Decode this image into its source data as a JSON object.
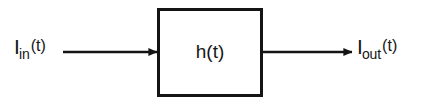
{
  "diagram": {
    "type": "block-diagram",
    "background_color": "#ffffff",
    "stroke_color": "#141414",
    "text_color": "#161616",
    "input": {
      "symbol": "I",
      "subscript": "in",
      "argument": "(t)",
      "full_text": "I_in(t)"
    },
    "output": {
      "symbol": "I",
      "subscript": "out",
      "argument": "(t)",
      "full_text": "I_out(t)"
    },
    "block": {
      "label": "h(t)",
      "shape": "rectangle"
    },
    "arrows": [
      {
        "name": "input-arrow",
        "direction": "right",
        "from_x": 63,
        "to_x": 157,
        "y": 52
      },
      {
        "name": "output-arrow",
        "direction": "right",
        "from_x": 263,
        "to_x": 352,
        "y": 52
      }
    ]
  }
}
